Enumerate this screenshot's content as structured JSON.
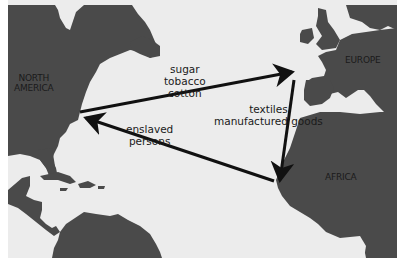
{
  "map": {
    "title": "Atlantic triangular trade",
    "colors": {
      "sea": "#ebebeb",
      "land": "#4a4a4a",
      "arrow": "#111111",
      "text": "#1a1a1a",
      "border": "#ffffff"
    },
    "regions": [
      {
        "id": "north-america",
        "lines": [
          "NORTH",
          "AMERICA"
        ]
      },
      {
        "id": "europe",
        "lines": [
          "EUROPE"
        ]
      },
      {
        "id": "africa",
        "lines": [
          "AFRICA"
        ]
      }
    ],
    "routes": [
      {
        "id": "americas-to-europe",
        "from": "North America",
        "to": "Europe",
        "goods": [
          "sugar",
          "tobacco",
          "cotton"
        ]
      },
      {
        "id": "europe-to-africa",
        "from": "Europe",
        "to": "Africa",
        "goods": [
          "textiles",
          "manufactured goods"
        ]
      },
      {
        "id": "africa-to-americas",
        "from": "Africa",
        "to": "North America",
        "goods": [
          "enslaved",
          "persons"
        ]
      }
    ]
  }
}
